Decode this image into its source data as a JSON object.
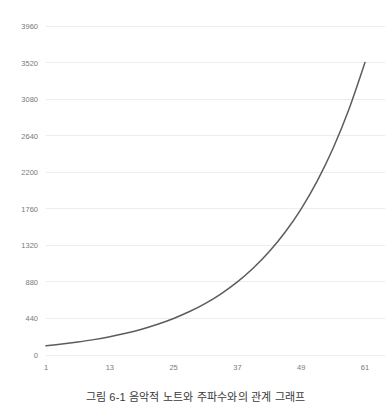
{
  "caption": "그림 6-1 음악적 노트와 주파수와의 관계 그래프",
  "colors": {
    "line": "#5c5c5c",
    "grid": "#ededed",
    "tick_text": "#7a7a7a",
    "caption_text": "#3a3a3a",
    "background": "#ffffff"
  },
  "chart_data": {
    "type": "line",
    "title": "",
    "subtitle": "",
    "xlabel": "",
    "ylabel": "",
    "xlim": [
      1,
      61
    ],
    "ylim": [
      0,
      3960
    ],
    "grid": "horizontal",
    "legend": "none",
    "x_ticks": [
      1,
      13,
      25,
      37,
      49,
      61
    ],
    "x_tick_labels": [
      "1",
      "13",
      "25",
      "37",
      "49",
      "61"
    ],
    "y_ticks": [
      0,
      440,
      880,
      1320,
      1760,
      2200,
      2640,
      3080,
      3520,
      3960
    ],
    "y_tick_labels": [
      "0",
      "440",
      "880",
      "1320",
      "1760",
      "2200",
      "2640",
      "3080",
      "3520",
      "3960"
    ],
    "series": [
      {
        "name": "frequency",
        "x": [
          1,
          4,
          7,
          10,
          13,
          16,
          19,
          22,
          25,
          28,
          31,
          34,
          37,
          40,
          43,
          46,
          49,
          52,
          55,
          58,
          61
        ],
        "values": [
          55,
          65,
          78,
          93,
          110,
          131,
          156,
          185,
          220,
          262,
          311,
          370,
          440,
          523,
          622,
          740,
          880,
          1047,
          1245,
          1480,
          1760
        ]
      }
    ],
    "series_note_values": {
      "x": [
        1,
        13,
        25,
        37,
        49,
        61
      ],
      "values": [
        55,
        110,
        220,
        440,
        880,
        1760
      ]
    },
    "plot_points": {
      "x": [
        1,
        4,
        7,
        10,
        13,
        16,
        19,
        22,
        25,
        28,
        31,
        34,
        37,
        40,
        43,
        46,
        49,
        52,
        55,
        58,
        61
      ],
      "y": [
        110,
        131,
        156,
        185,
        220,
        262,
        311,
        370,
        440,
        523,
        622,
        740,
        880,
        1047,
        1245,
        1480,
        1760,
        2093,
        2489,
        2960,
        3520
      ]
    }
  }
}
